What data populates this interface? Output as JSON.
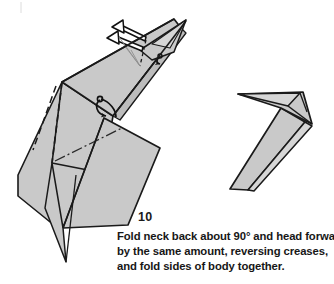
{
  "page": {
    "width": 334,
    "height": 284,
    "background": "#ffffff"
  },
  "step": {
    "number": "10",
    "caption_lines": [
      "Fold neck back about 90° and head forward",
      "by the same amount, reversing creases,",
      "and fold sides of body together."
    ],
    "caption_full": "Fold neck back about 90° and head forward by the same amount, reversing creases, and fold sides of body together."
  },
  "diagram": {
    "style": {
      "paper_fill": "#c9c9c9",
      "paper_fill_light": "#d6d6d6",
      "paper_fill_shade": "#bcbcbc",
      "outline": "#1a1a1a",
      "crease_dashed": "#1a1a1a",
      "crease_dashdot": "#2a2a2a",
      "arrow": "#111111",
      "white": "#ffffff"
    },
    "figures": [
      {
        "name": "before-fold-model",
        "description": "Large left model showing long neck and head with reverse-fold creases and body panels"
      },
      {
        "name": "after-fold-model",
        "description": "Smaller right model showing the completed folded result with head forward and sides of body together"
      }
    ],
    "annotations": [
      {
        "name": "head-fold-arrow-upper",
        "meaning": "fold head forward about 90 degrees"
      },
      {
        "name": "head-fold-arrow-lower",
        "meaning": "reverse crease at head"
      },
      {
        "name": "neck-reverse-arrow",
        "meaning": "fold neck back about 90 degrees"
      },
      {
        "name": "body-close-arrow",
        "meaning": "fold sides of body together"
      }
    ]
  }
}
